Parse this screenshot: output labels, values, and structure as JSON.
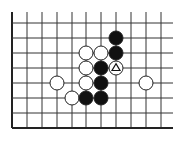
{
  "diagram": {
    "type": "go-board-fragment",
    "grid": {
      "columns": 11,
      "rows": 8,
      "col_x": [
        12,
        27,
        42,
        57,
        72,
        86,
        101,
        116,
        131,
        146,
        161
      ],
      "row_y": [
        23,
        38,
        53,
        68,
        83,
        98,
        113,
        128
      ],
      "edges": {
        "left": true,
        "bottom": true,
        "top": false,
        "right": false
      },
      "line_color": "#333333",
      "edge_color": "#222222"
    },
    "stone_radius": 7,
    "colors": {
      "black": "#111111",
      "white": "#ffffff",
      "stone_outline": "#222222"
    },
    "stones": [
      {
        "color": "black",
        "col": 7,
        "row": 1
      },
      {
        "color": "black",
        "col": 7,
        "row": 2
      },
      {
        "color": "white",
        "col": 5,
        "row": 2
      },
      {
        "color": "white",
        "col": 6,
        "row": 2
      },
      {
        "color": "white",
        "col": 5,
        "row": 3
      },
      {
        "color": "black",
        "col": 6,
        "row": 3
      },
      {
        "color": "white",
        "col": 7,
        "row": 3,
        "marker": "triangle"
      },
      {
        "color": "white",
        "col": 3,
        "row": 4
      },
      {
        "color": "white",
        "col": 5,
        "row": 4
      },
      {
        "color": "black",
        "col": 6,
        "row": 4
      },
      {
        "color": "white",
        "col": 9,
        "row": 4
      },
      {
        "color": "white",
        "col": 4,
        "row": 5
      },
      {
        "color": "black",
        "col": 5,
        "row": 5
      },
      {
        "color": "black",
        "col": 6,
        "row": 5
      }
    ]
  }
}
